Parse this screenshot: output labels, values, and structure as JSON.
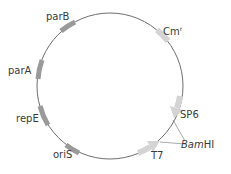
{
  "diagram": {
    "type": "plasmid-map",
    "backbone_color": "#6e6e6e",
    "feature_color_dark": "#9a9a9a",
    "feature_color_light": "#d4d4d4",
    "features": [
      {
        "id": "parB",
        "label": "parB"
      },
      {
        "id": "parA",
        "label": "parA"
      },
      {
        "id": "repE",
        "label": "repE"
      },
      {
        "id": "oriS",
        "label": "oriS"
      },
      {
        "id": "cmr",
        "label": "Cm",
        "superscript": "r"
      },
      {
        "id": "sp6",
        "label": "SP6"
      },
      {
        "id": "t7",
        "label": "T7"
      }
    ],
    "sites": [
      {
        "id": "bamhi",
        "label_italic": "Bam",
        "label_normal": "HI"
      }
    ]
  }
}
